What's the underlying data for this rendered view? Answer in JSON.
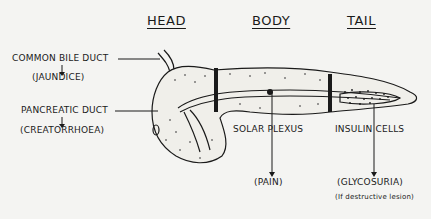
{
  "headers": {
    "head": "HEAD",
    "body": "BODY",
    "tail": "TAIL"
  },
  "labels": {
    "common_bile_duct": "COMMON BILE DUCT",
    "jaundice": "(JAUNDICE)",
    "pancreatic_duct": "PANCREATIC DUCT",
    "creatorrhoea": "(CREATORRHOEA)",
    "solar_plexus": "SOLAR PLEXUS",
    "pain": "(PAIN)",
    "insulin_cells": "INSULIN CELLS",
    "glycosuria": "(GLYCOSURIA)",
    "glycosuria_note": "(If destructive lesion)"
  },
  "colors": {
    "ink": "#1a1a1a",
    "paper": "#f4f4f2"
  }
}
